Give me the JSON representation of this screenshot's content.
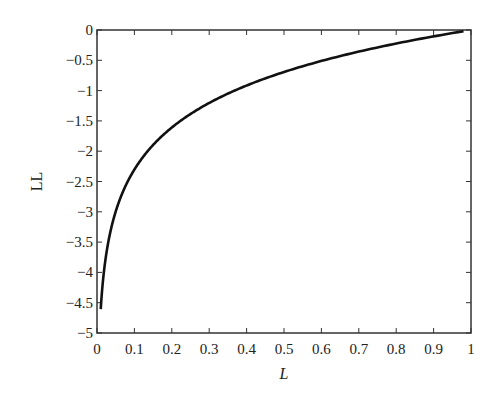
{
  "chart_data": {
    "type": "line",
    "title": "",
    "xlabel": "L",
    "ylabel": "LL",
    "xlim": [
      0,
      1
    ],
    "ylim": [
      -5,
      0
    ],
    "grid": false,
    "legend": null,
    "x_ticks": [
      "0",
      "0.1",
      "0.2",
      "0.3",
      "0.4",
      "0.5",
      "0.6",
      "0.7",
      "0.8",
      "0.9",
      "1"
    ],
    "y_ticks": [
      "0",
      "−0.5",
      "−1",
      "−1.5",
      "−2",
      "−2.5",
      "−3",
      "−3.5",
      "−4",
      "−4.5",
      "−5"
    ],
    "series": [
      {
        "name": "LL = ln(L)",
        "x": [
          0.01,
          0.02,
          0.03,
          0.05,
          0.07,
          0.1,
          0.15,
          0.2,
          0.25,
          0.3,
          0.4,
          0.5,
          0.6,
          0.7,
          0.8,
          0.9,
          0.98
        ],
        "y": [
          -4.6,
          -3.91,
          -3.51,
          -3.0,
          -2.66,
          -2.3,
          -1.9,
          -1.61,
          -1.39,
          -1.2,
          -0.92,
          -0.69,
          -0.51,
          -0.36,
          -0.22,
          -0.11,
          -0.02
        ]
      }
    ]
  }
}
